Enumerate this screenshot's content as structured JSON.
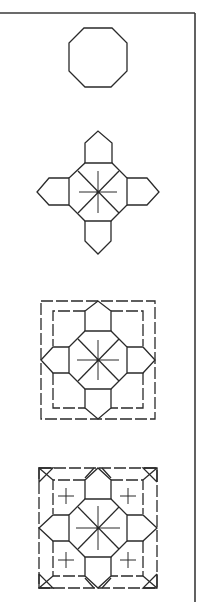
{
  "figure": {
    "line_color": "#2a2a2a",
    "background": "#ffffff",
    "steps": [
      {
        "index": 1,
        "shape": "octagon",
        "center": [
          98,
          57
        ]
      },
      {
        "index": 2,
        "shape": "octagon-with-four-pentagons-and-star",
        "center": [
          98,
          192
        ]
      },
      {
        "index": 3,
        "shape": "tile-with-dashed-square-frame",
        "center": [
          98,
          360
        ]
      },
      {
        "index": 4,
        "shape": "full-tile-with-corner-triangles-and-crosses",
        "center": [
          98,
          528
        ]
      }
    ]
  }
}
